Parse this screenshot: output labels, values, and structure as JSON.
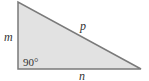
{
  "diagram": {
    "type": "right-triangle",
    "colors": {
      "fill": "#e2e2e2",
      "stroke": "#7a7a7a",
      "text": "#333333"
    },
    "labels": {
      "vertical_side": "m",
      "hypotenuse": "p",
      "horizontal_side": "n",
      "right_angle": "90°"
    }
  }
}
